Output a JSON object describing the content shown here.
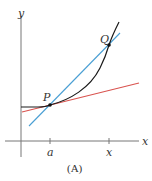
{
  "figure": {
    "caption": "(A)",
    "axes": {
      "x_label": "x",
      "y_label": "y",
      "ticks": [
        {
          "label": "a",
          "px": 50
        },
        {
          "label": "x",
          "px": 109
        }
      ]
    },
    "points": [
      {
        "label": "P",
        "px": 50,
        "py": 105
      },
      {
        "label": "Q",
        "px": 109,
        "py": 45
      }
    ],
    "curves": [
      {
        "name": "function-curve",
        "color": "#1a1a1a"
      },
      {
        "name": "tangent-line-at-P",
        "color": "#d9534f"
      },
      {
        "name": "secant-line-PQ",
        "color": "#4a9fd4"
      }
    ],
    "colors": {
      "axis": "#666666",
      "curve": "#1a1a1a",
      "tangent": "#d9534f",
      "secant": "#4a9fd4"
    }
  }
}
